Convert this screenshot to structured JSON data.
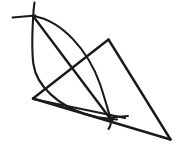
{
  "figure": {
    "canvas": {
      "width": 185,
      "height": 154
    },
    "style": {
      "ink_color": "#1a1a1a",
      "background_color": "#ffffff",
      "stroke_width": 2.1
    },
    "points": {
      "A": {
        "label": "upper-left intersection",
        "x": 33,
        "y": 16
      },
      "B": {
        "label": "lower intersection",
        "x": 110,
        "y": 118
      },
      "C": {
        "label": "triangle apex",
        "x": 108,
        "y": 39
      },
      "D": {
        "label": "triangle left vertex",
        "x": 33,
        "y": 98
      },
      "E": {
        "label": "triangle right vertex",
        "x": 170,
        "y": 139
      },
      "X": {
        "label": "central crossing",
        "x": 73,
        "y": 68
      }
    },
    "strokes": [
      {
        "name": "arc-right-bulge",
        "kind": "arc",
        "d": "M 33.5 16 C 62 21, 88 50, 100 84 C 105 99, 108 110, 110.5 118.5 C 111.5 123, 110 127, 108.5 129"
      },
      {
        "name": "arc-left-bulge",
        "kind": "arc",
        "d": "M 34.5 2.5 C 33.8 7, 33.4 12, 33.2 16.5 C 32.2 33, 31.6 50, 33.4 64 C 36.5 87, 60 106, 85 114 C 94 117, 103 118.5, 117 119.5"
      },
      {
        "name": "chord-A-to-B",
        "kind": "line",
        "d": "M 33 16 L 112 121"
      },
      {
        "name": "line-upper-left-tick",
        "kind": "line",
        "d": "M 12.5 17.5 L 35.5 15.5"
      },
      {
        "name": "line-D-to-C",
        "kind": "line",
        "d": "M 33 98.5 L 108.5 39.5"
      },
      {
        "name": "triangle-side-C-to-E",
        "kind": "line",
        "d": "M 108.5 39.5 L 170.5 139.5"
      },
      {
        "name": "triangle-base-E-to-D",
        "kind": "line",
        "d": "M 170.5 139.5 L 33 98.5"
      },
      {
        "name": "line-D-through-B-lower",
        "kind": "line",
        "d": "M 33 99 L 125 118"
      },
      {
        "name": "tick-right-of-B",
        "kind": "line",
        "d": "M 110 117.5 L 128 116"
      }
    ]
  }
}
